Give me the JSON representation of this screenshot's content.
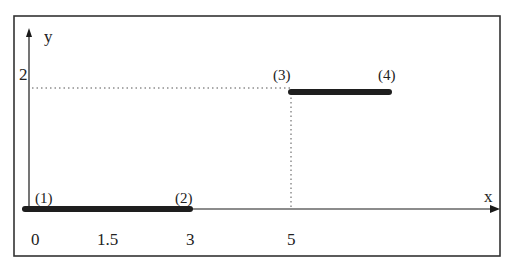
{
  "diagram": {
    "axes": {
      "x_label": "x",
      "y_label": "y",
      "x_ticks": [
        "0",
        "1.5",
        "3",
        "5"
      ],
      "y_ticks": [
        "2"
      ]
    },
    "points": [
      {
        "label": "(1)",
        "x": 0,
        "y": 0
      },
      {
        "label": "(2)",
        "x": 3,
        "y": 0
      },
      {
        "label": "(3)",
        "x": 5,
        "y": 2
      },
      {
        "label": "(4)",
        "x": 7,
        "y": 2
      }
    ],
    "segments": [
      {
        "from": "(1)",
        "to": "(2)",
        "y": 0
      },
      {
        "from": "(3)",
        "to": "(4)",
        "y": 2
      }
    ],
    "guides": [
      {
        "type": "horizontal-dotted",
        "at_y": 2
      },
      {
        "type": "vertical-dotted",
        "at_x": 5
      }
    ],
    "colors": {
      "line": "#1a1a1a",
      "thick_segment": "#1e1e1e",
      "frame": "#333333",
      "background": "#ffffff"
    }
  }
}
